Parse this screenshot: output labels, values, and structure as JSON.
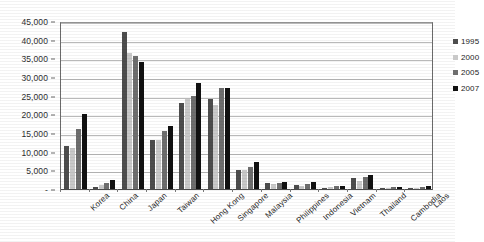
{
  "chart_data": {
    "type": "bar",
    "title": "",
    "xlabel": "",
    "ylabel": "",
    "ylim": [
      0,
      45000
    ],
    "ytick_labels": [
      "45,000",
      "40,000",
      "35,000",
      "30,000",
      "25,000",
      "20,000",
      "15,000",
      "10,000",
      "5,000",
      "-"
    ],
    "ytick_values": [
      45000,
      40000,
      35000,
      30000,
      25000,
      20000,
      15000,
      10000,
      5000,
      0
    ],
    "grid": true,
    "legend_position": "top-right-inside",
    "categories": [
      "Korea",
      "China",
      "Japan",
      "Taiwan",
      "Hong Kong",
      "Singapore",
      "Malaysia",
      "Philippines",
      "Indonesia",
      "Vietnam",
      "Thailand",
      "Cambodia",
      "Laos"
    ],
    "series": [
      {
        "name": "1995",
        "color": "#4d4d4d",
        "values": [
          11500,
          600,
          42000,
          13000,
          23000,
          24000,
          5000,
          1500,
          1200,
          350,
          3000,
          350,
          350
        ]
      },
      {
        "name": "2000",
        "color": "#c9c9c9",
        "values": [
          11000,
          950,
          36500,
          13000,
          24000,
          22500,
          5200,
          1400,
          900,
          450,
          2200,
          350,
          350
        ]
      },
      {
        "name": "2005",
        "color": "#6e6e6e",
        "values": [
          16000,
          1700,
          35500,
          15500,
          25000,
          27000,
          6000,
          1600,
          1400,
          700,
          3200,
          500,
          500
        ]
      },
      {
        "name": "2007",
        "color": "#111111",
        "values": [
          20000,
          2500,
          34000,
          17000,
          28500,
          27000,
          7200,
          1800,
          1900,
          850,
          3800,
          600,
          700
        ]
      }
    ]
  },
  "legend": {
    "entries": [
      {
        "label": "1995",
        "color": "#4d4d4d"
      },
      {
        "label": "2000",
        "color": "#c9c9c9"
      },
      {
        "label": "2005",
        "color": "#6e6e6e"
      },
      {
        "label": "2007",
        "color": "#111111"
      }
    ]
  }
}
